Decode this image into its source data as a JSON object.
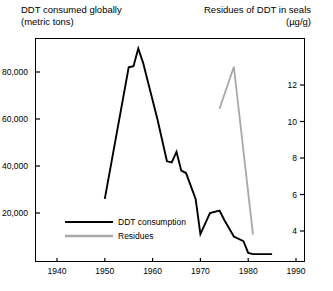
{
  "header": {
    "left_title": "DDT consumed globally\n(metric tons)",
    "right_title": "Residues of DDT in seals\n(µg/g)"
  },
  "axes": {
    "x_ticks": [
      "1940",
      "1950",
      "1960",
      "1970",
      "1980",
      "1990"
    ],
    "y_left_ticks": [
      "20,000",
      "40,000",
      "60,000",
      "80,000"
    ],
    "y_right_ticks": [
      "4",
      "6",
      "8",
      "10",
      "12"
    ]
  },
  "legend": {
    "items": [
      {
        "label": "DDT consumption",
        "color": "#000000"
      },
      {
        "label": "Residues",
        "color": "#a8a8a8"
      }
    ]
  },
  "chart_data": {
    "type": "line",
    "xlabel": "",
    "ylabel": "DDT consumed globally (metric tons)",
    "y2label": "Residues of DDT in seals (µg/g)",
    "xlim": [
      1940,
      1990
    ],
    "ylim": [
      0,
      95000
    ],
    "y2lim": [
      0,
      14
    ],
    "grid": false,
    "legend_position": "inside-left",
    "series": [
      {
        "name": "DDT consumption",
        "axis": "left",
        "units": "metric tons",
        "color": "#000000",
        "x": [
          1950,
          1955,
          1956,
          1957,
          1958,
          1961,
          1963,
          1964,
          1965,
          1966,
          1967,
          1969,
          1970,
          1972,
          1974,
          1975,
          1977,
          1979,
          1980,
          1981,
          1983,
          1985
        ],
        "y": [
          26000,
          82000,
          82500,
          90000,
          84000,
          60000,
          42000,
          41500,
          46000,
          38000,
          37000,
          26000,
          11000,
          20000,
          21000,
          17000,
          10000,
          8000,
          3000,
          2500,
          2500,
          2500
        ]
      },
      {
        "name": "Residues",
        "axis": "right",
        "units": "µg/g",
        "color": "#a8a8a8",
        "x": [
          1974,
          1977,
          1981
        ],
        "y": [
          10.7,
          13.0,
          3.8
        ]
      }
    ]
  },
  "geometry": {
    "plot": {
      "left": 35,
      "top": 38,
      "right": 305,
      "bottom": 262
    },
    "x_axis": {
      "year_min": 1940,
      "px_min": 57,
      "year_max": 1990,
      "px_max": 296
    },
    "y_left_axis": {
      "val_min": 20000,
      "px_min": 213,
      "val_max": 80000,
      "px_max": 72
    },
    "y_right_axis": {
      "val_min": 4,
      "px_min": 231,
      "val_max": 12,
      "px_max": 85
    },
    "legend_anchor": {
      "line_x1": 65,
      "line_x2": 113,
      "label_x": 118,
      "row1_y": 222,
      "row2_y": 236
    }
  }
}
